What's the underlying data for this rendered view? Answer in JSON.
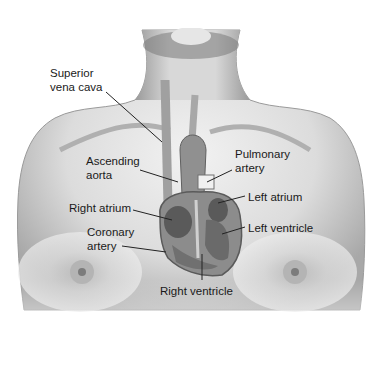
{
  "diagram": {
    "labels": {
      "superior_vena_cava": [
        "Superior",
        "vena cava"
      ],
      "ascending_aorta": [
        "Ascending",
        "aorta"
      ],
      "pulmonary_artery": [
        "Pulmonary",
        "artery"
      ],
      "left_atrium": "Left atrium",
      "right_atrium": "Right atrium",
      "left_ventricle": "Left ventricle",
      "coronary_artery": [
        "Coronary",
        "artery"
      ],
      "right_ventricle": "Right ventricle"
    },
    "colors": {
      "skin_light": "#eeeeee",
      "skin_mid": "#c8c8c8",
      "skin_dark": "#8a8a8a",
      "heart_dark": "#5a5a5a",
      "heart_mid": "#8c8c8c",
      "leader_line": "#222222",
      "text": "#1a1a1a"
    }
  }
}
